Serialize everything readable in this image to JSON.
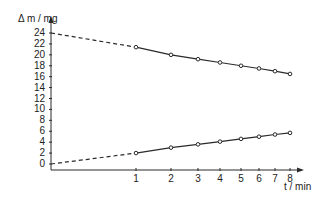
{
  "chart_data": {
    "type": "line",
    "title": "",
    "xlabel": "t / min",
    "ylabel": "Δ m / mg",
    "x_scale": "log",
    "x": [
      1,
      2,
      3,
      4,
      5,
      6,
      7,
      8
    ],
    "x_ticks": [
      "1",
      "2",
      "3",
      "4",
      "5",
      "6",
      "7",
      "8"
    ],
    "y_ticks": [
      "0",
      "2",
      "4",
      "6",
      "8",
      "10",
      "12",
      "14",
      "16",
      "18",
      "20",
      "22",
      "24"
    ],
    "ylim": [
      0,
      25
    ],
    "grid": false,
    "legend": null,
    "series": [
      {
        "name": "upper (decreasing)",
        "values": [
          21.4,
          20.0,
          19.2,
          18.6,
          18.0,
          17.5,
          17.0,
          16.5
        ],
        "extrapolated_intercept": 24,
        "marker": "open-circle"
      },
      {
        "name": "lower (increasing)",
        "values": [
          2.0,
          3.0,
          3.6,
          4.1,
          4.6,
          5.0,
          5.4,
          5.7
        ],
        "extrapolated_intercept": 0,
        "marker": "open-circle"
      }
    ],
    "annotations": [
      "dashed extrapolation of both lines back to t-axis origin"
    ]
  },
  "axes": {
    "y_title": "Δ m / mg",
    "x_title": "t / min"
  },
  "colors": {
    "line": "#2a2a2a",
    "background": "#ffffff"
  }
}
